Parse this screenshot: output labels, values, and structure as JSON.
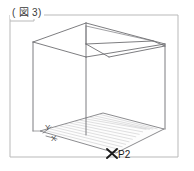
{
  "figure": {
    "label": "( 図 3)",
    "label_plain": "(図 3)",
    "caption_number": "3"
  },
  "diagram": {
    "type": "3d-wireframe-box-with-ground-plane",
    "axes": [
      {
        "name": "y-axis-label",
        "label": "Y"
      },
      {
        "name": "x-axis-label",
        "label": "X"
      }
    ],
    "points": [
      {
        "name": "point-p2",
        "label": "P2",
        "marker": "x-cross-marker"
      }
    ],
    "colors": {
      "frame_border": "#b9b9b9",
      "box_edge": "#6e6e72",
      "floor_outline": "#77777b",
      "floor_hatch": "#b0b0b4",
      "marker": "#1b1b1b",
      "background": "#ffffff"
    }
  }
}
